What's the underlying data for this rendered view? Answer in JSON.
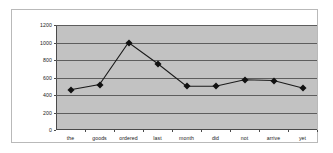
{
  "chart_data": {
    "type": "line",
    "title": "",
    "subtitle": "",
    "xlabel": "",
    "ylabel": "",
    "categories": [
      "the",
      "goods",
      "ordered",
      "last",
      "month",
      "did",
      "not",
      "arrive",
      "yet"
    ],
    "values": [
      460,
      520,
      1000,
      760,
      500,
      500,
      575,
      565,
      480
    ],
    "series": [
      {
        "name": "Series 1",
        "values": [
          460,
          520,
          1000,
          760,
          500,
          500,
          575,
          565,
          480
        ]
      }
    ],
    "ylim": [
      0,
      1200
    ],
    "ytick_values": [
      0,
      200,
      400,
      600,
      800,
      1000,
      1200
    ],
    "ytick_labels": [
      "0",
      "200",
      "400",
      "600",
      "800",
      "1000",
      "1200"
    ],
    "grid": "horizontal",
    "legend": "none",
    "marker": "diamond",
    "marker_color": "#111111",
    "line_color": "#1a1a1a",
    "plot_background": "#c2c2c2",
    "figure_background": "#ffffff",
    "gridline_color": "#5d5d5d",
    "axis_color": "#4a4a4a",
    "annotations": []
  }
}
